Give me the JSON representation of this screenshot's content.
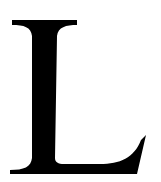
{
  "glyph": {
    "character": "L",
    "color": "#000000",
    "background": "#ffffff",
    "style": "serif capital letter"
  }
}
